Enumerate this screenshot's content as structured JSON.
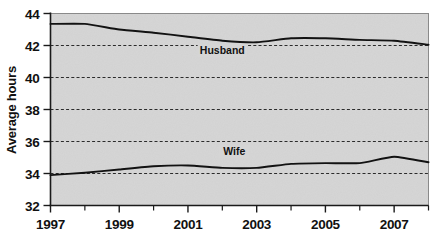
{
  "chart_data": {
    "type": "line",
    "title": "",
    "xlabel": "",
    "ylabel": "Average hours",
    "xlim": [
      1997,
      2008
    ],
    "ylim": [
      32,
      44
    ],
    "grid": true,
    "grid_values": [
      34,
      36,
      38,
      40,
      42
    ],
    "legend_position": "inline-annotation",
    "y_ticks": [
      32,
      34,
      36,
      38,
      40,
      42,
      44
    ],
    "y_tick_labels": [
      "32",
      "34",
      "36",
      "38",
      "40",
      "42",
      "44"
    ],
    "x_ticks": [
      1997,
      1998,
      1999,
      2000,
      2001,
      2002,
      2003,
      2004,
      2005,
      2006,
      2007,
      2008
    ],
    "x_tick_labels": [
      "1997",
      "",
      "1999",
      "",
      "2001",
      "",
      "2003",
      "",
      "2005",
      "",
      "2007",
      ""
    ],
    "x": [
      1997,
      1998,
      1999,
      2000,
      2001,
      2002,
      2003,
      2004,
      2005,
      2006,
      2007,
      2008
    ],
    "series": [
      {
        "name": "Husband",
        "color": "#121212",
        "values": [
          43.35,
          43.35,
          43.0,
          42.8,
          42.55,
          42.3,
          42.2,
          42.45,
          42.45,
          42.35,
          42.3,
          42.05
        ],
        "label_text": "Husband",
        "label_x": 2002.0,
        "label_y": 41.45
      },
      {
        "name": "Wife",
        "color": "#121212",
        "values": [
          33.9,
          34.05,
          34.25,
          34.45,
          34.5,
          34.35,
          34.35,
          34.6,
          34.65,
          34.65,
          35.05,
          34.7
        ],
        "label_text": "Wife",
        "label_x": 2002.35,
        "label_y": 35.15
      }
    ],
    "plot_background_color": "#d5d5d5",
    "page_background_color": "#ffffff",
    "axis_color": "#1a1a1a"
  }
}
